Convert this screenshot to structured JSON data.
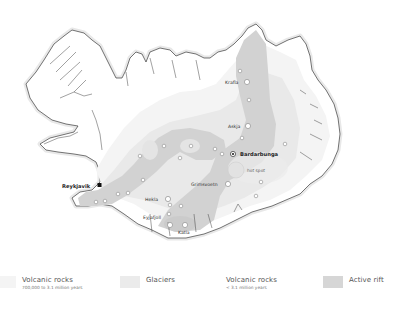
{
  "map": {
    "colors": {
      "island_fill": "#ffffff",
      "coast_stroke": "#444444",
      "coast_halo": "#e6e6e6",
      "old_rocks": "#f7f7f7",
      "glaciers": "#ebebeb",
      "young_rocks": "#e2e2e2",
      "active_rift": "#cfcfcf",
      "volcano_stroke": "#bbbbbb"
    },
    "labels": {
      "krafla": "Krafla",
      "askja": "Askja",
      "bardarbunga": "Bardarbunga",
      "hot_spot": "hot spot",
      "grimsvoetn": "Grimsvoetn",
      "reykjavik": "Reykjavik",
      "hekla": "Hekla",
      "eyjafjoll": "Eyjafjoll",
      "katla": "Katla"
    }
  },
  "legend": {
    "items": [
      {
        "title": "Volcanic rocks",
        "subtitle": "700,000 to 3.1 million years",
        "color": "#f4f4f4"
      },
      {
        "title": "Glaciers",
        "subtitle": "",
        "color": "#ebebeb"
      },
      {
        "title": "Volcanic rocks",
        "subtitle": "< 3.1 million years",
        "color": "#ffffff"
      },
      {
        "title": "Active rift",
        "subtitle": "",
        "color": "#d6d6d6"
      }
    ]
  }
}
